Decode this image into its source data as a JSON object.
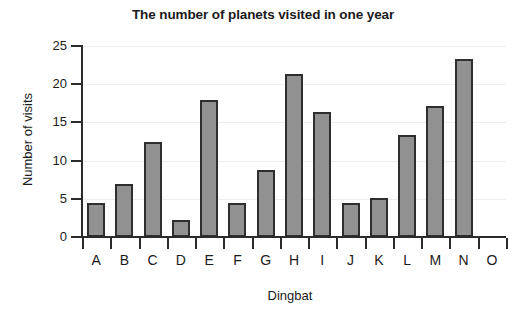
{
  "chart_data": {
    "type": "bar",
    "title": "The number of planets visited in one year",
    "xlabel": "Dingbat",
    "ylabel": "Number of visits",
    "categories": [
      "A",
      "B",
      "C",
      "D",
      "E",
      "F",
      "G",
      "H",
      "I",
      "J",
      "K",
      "L",
      "M",
      "N",
      "O"
    ],
    "values": [
      4.4,
      7.0,
      12.5,
      2.2,
      17.9,
      4.5,
      8.8,
      21.3,
      16.4,
      4.5,
      5.1,
      13.4,
      17.1,
      23.3,
      0
    ],
    "ylim": [
      0,
      25
    ],
    "yticks": [
      0,
      5,
      10,
      15,
      20,
      25
    ],
    "ytick_labels": [
      "0",
      "5",
      "10",
      "15",
      "20",
      "25"
    ],
    "grid": true,
    "legend": false,
    "bar_color": "#919191",
    "bar_edge_color": "#2e2e2e",
    "axis_color": "#2b2b2b",
    "grid_color": "#eeeeee",
    "text_color": "#1b1b1b",
    "background": "#ffffff"
  }
}
